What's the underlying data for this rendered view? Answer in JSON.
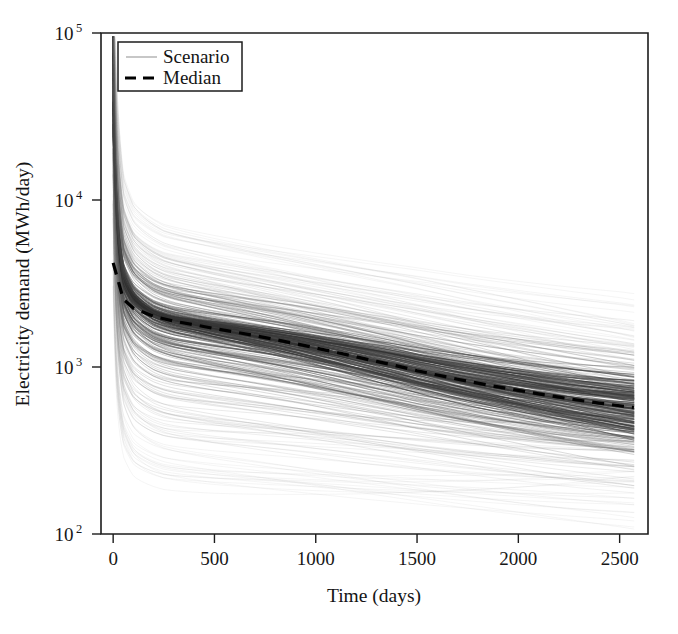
{
  "figure": {
    "width": 678,
    "height": 634,
    "background": "#ffffff"
  },
  "chart_data": {
    "type": "line",
    "title": "",
    "subtitle": "",
    "xlabel": "Time (days)",
    "ylabel": "Electricity demand (MWh/day)",
    "xscale": "linear",
    "yscale": "log",
    "xlim": [
      -60,
      2640
    ],
    "ylim": [
      100,
      100000
    ],
    "xticks": [
      0,
      500,
      1000,
      1500,
      2000,
      2500
    ],
    "xtick_labels": [
      "0",
      "500",
      "1000",
      "1500",
      "2000",
      "2500"
    ],
    "yticks": [
      100,
      1000,
      10000,
      100000
    ],
    "ytick_labels": [
      "10",
      "10",
      "10",
      "10"
    ],
    "ytick_exponents": [
      "2",
      "3",
      "4",
      "5"
    ],
    "grid": false,
    "legend_position": "upper left",
    "legend_entries": [
      {
        "label": "Scenario",
        "style": "solid",
        "color": "#9a9a9a",
        "width": 1.1
      },
      {
        "label": "Median",
        "style": "dashed",
        "color": "#000000",
        "width": 3.1
      }
    ],
    "n_scenarios": 320,
    "x_data_range": [
      0,
      2570
    ],
    "series": [
      {
        "name": "Median",
        "style": "dashed",
        "color": "#000000",
        "x": [
          0,
          50,
          100,
          200,
          300,
          400,
          500,
          600,
          700,
          800,
          900,
          1000,
          1100,
          1200,
          1300,
          1400,
          1500,
          1600,
          1700,
          1800,
          1900,
          2000,
          2100,
          2200,
          2300,
          2400,
          2500,
          2570
        ],
        "y": [
          4200,
          2550,
          2250,
          2010,
          1880,
          1790,
          1700,
          1620,
          1540,
          1460,
          1380,
          1300,
          1225,
          1150,
          1080,
          1015,
          950,
          895,
          845,
          800,
          760,
          725,
          690,
          660,
          632,
          608,
          586,
          572
        ]
      }
    ],
    "envelope": {
      "description": "Approximate vertical spread of the scenario bundle at sampled times",
      "x": [
        0,
        50,
        100,
        250,
        500,
        750,
        1000,
        1250,
        1500,
        1750,
        2000,
        2250,
        2500,
        2570
      ],
      "upper": [
        35000,
        12000,
        9600,
        8000,
        6900,
        6000,
        5300,
        4700,
        4200,
        3700,
        3300,
        2950,
        2650,
        2550
      ],
      "lower": [
        300,
        175,
        150,
        138,
        132,
        128,
        125,
        122,
        120,
        118,
        116,
        114,
        112,
        111
      ],
      "p25": [
        2400,
        1450,
        1250,
        1080,
        930,
        840,
        760,
        700,
        645,
        600,
        560,
        525,
        495,
        485
      ],
      "p75": [
        7200,
        4300,
        3800,
        3350,
        2950,
        2680,
        2450,
        2270,
        2100,
        1960,
        1830,
        1720,
        1620,
        1580
      ]
    }
  },
  "axes": {
    "plot_left": 101,
    "plot_right": 648,
    "plot_top": 33,
    "plot_bottom": 534
  },
  "legend": {
    "scenario_label": "Scenario",
    "median_label": "Median"
  }
}
